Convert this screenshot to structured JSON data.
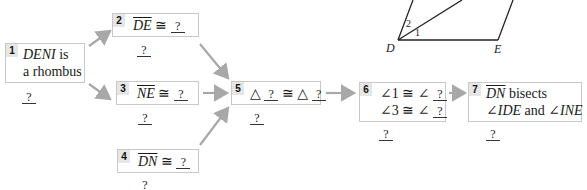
{
  "figure": {
    "labels": {
      "D": "D",
      "E": "E",
      "angle1": "1",
      "angle2": "2"
    }
  },
  "steps": [
    {
      "number": "1",
      "line1_a": "DENI",
      "line1_b": " is",
      "line2": "a rhombus",
      "reason": "?"
    },
    {
      "number": "2",
      "segment": "DE",
      "congruent": "≅",
      "blank": "?",
      "reason": "?"
    },
    {
      "number": "3",
      "segment": "NE",
      "congruent": "≅",
      "blank": "?",
      "reason": "?"
    },
    {
      "number": "4",
      "segment": "DN",
      "congruent": "≅",
      "blank": "?",
      "reason": "?"
    },
    {
      "number": "5",
      "triangle": "△",
      "blank1": "?",
      "congruent": "≅",
      "blank2": "?",
      "reason": "?"
    },
    {
      "number": "6",
      "line1_angle": "∠1",
      "line1_rel": "≅ ∠",
      "line1_blank": "?",
      "line2_angle": "∠3",
      "line2_rel": "≅ ∠",
      "line2_blank": "?",
      "reason": "?"
    },
    {
      "number": "7",
      "segment": "DN",
      "bisects": " bisects",
      "angle_a": "∠IDE",
      "and": " and ",
      "angle_b": "∠INE",
      "reason": "?"
    }
  ],
  "colors": {
    "arrow": "#a8a8a8",
    "box_border": "#c8c8c8",
    "number_bg": "#e6e6e6",
    "figure_line": "#222222"
  }
}
